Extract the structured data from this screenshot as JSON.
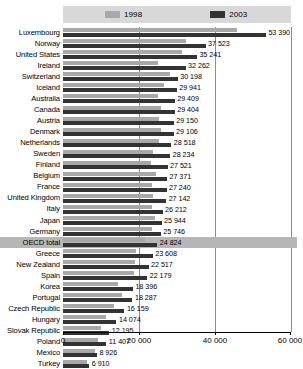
{
  "legend": {
    "entries": [
      {
        "label": "1998",
        "color": "#a8a8a8",
        "icon": "legend-swatch-1998"
      },
      {
        "label": "2003",
        "color": "#333333",
        "icon": "legend-swatch-2003"
      }
    ]
  },
  "axis": {
    "ticks": [
      "0",
      "20 000",
      "40 000",
      "60 000"
    ],
    "tick_values": [
      0,
      20000,
      40000,
      60000
    ]
  },
  "chart_data": {
    "type": "bar",
    "orientation": "horizontal",
    "title": "",
    "xlabel": "",
    "ylabel": "",
    "xlim": [
      0,
      60000
    ],
    "grid": true,
    "legend_position": "top",
    "categories": [
      "Luxembourg",
      "Norway",
      "United States",
      "Ireland",
      "Switzerland",
      "Iceland",
      "Australia",
      "Canada",
      "Austria",
      "Denmark",
      "Netherlands",
      "Sweden",
      "Finland",
      "Belgium",
      "France",
      "United Kingdom",
      "Italy",
      "Japan",
      "Germany",
      "OECD total",
      "Greece",
      "New Zealand",
      "Spain",
      "Korea",
      "Portugal",
      "Czech Republic",
      "Hungary",
      "Slovak Republic",
      "Poland",
      "Mexico",
      "Turkey"
    ],
    "highlight_category": "OECD total",
    "value_labels": [
      "53 390",
      "37 523",
      "35 241",
      "32 262",
      "30 198",
      "29 941",
      "29 409",
      "29 404",
      "29 150",
      "29 106",
      "28 518",
      "28 234",
      "27 521",
      "27 371",
      "27 240",
      "27 142",
      "26 212",
      "25 944",
      "25 746",
      "24 824",
      "23 608",
      "22 517",
      "22 179",
      "18 396",
      "18 287",
      "16 159",
      "14 074",
      "12 195",
      "11 407",
      "8 926",
      "6 910"
    ],
    "series": [
      {
        "name": "2003",
        "color": "#333333",
        "values": [
          53390,
          37523,
          35241,
          32262,
          30198,
          29941,
          29409,
          29404,
          29150,
          29106,
          28518,
          28234,
          27521,
          27371,
          27240,
          27142,
          26212,
          25944,
          25746,
          24824,
          23608,
          22517,
          22179,
          18396,
          18287,
          16159,
          14074,
          12195,
          11407,
          8926,
          6910
        ]
      },
      {
        "name": "1998",
        "color": "#a8a8a8",
        "values": [
          45800,
          32300,
          31200,
          24900,
          28100,
          26600,
          24900,
          25800,
          25300,
          25700,
          25200,
          23600,
          23200,
          24500,
          23400,
          23700,
          23300,
          24300,
          23400,
          21700,
          19300,
          18900,
          18700,
          14600,
          15600,
          13300,
          11300,
          9900,
          9200,
          8300,
          6400
        ]
      }
    ]
  }
}
